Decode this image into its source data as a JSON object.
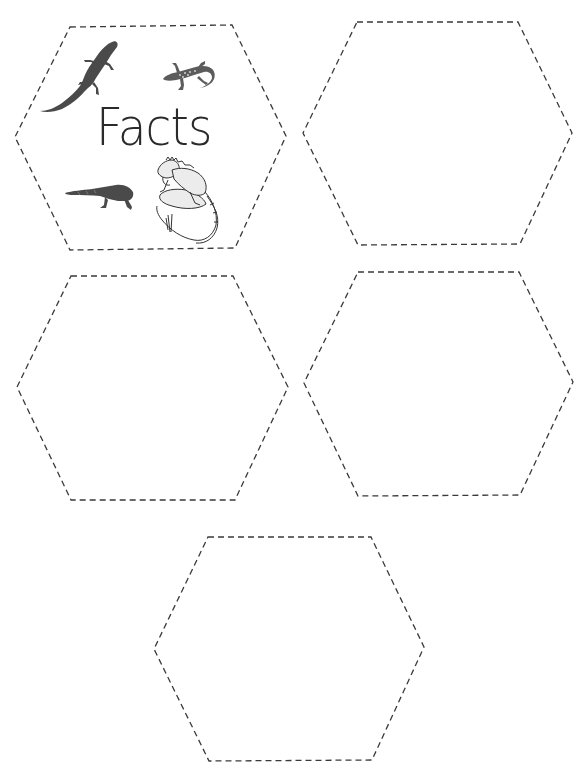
{
  "worksheet": {
    "title": "Facts",
    "colors": {
      "background": "#ffffff",
      "outline": "#3a3a3a",
      "text": "#2a2a2a"
    },
    "cards": [
      {
        "id": 1,
        "shape": "hexagon",
        "outline": "dashed",
        "label": "Facts",
        "illustrations": [
          "collared-lizard-icon",
          "gecko-icon",
          "gila-monster-icon",
          "iguana-icon"
        ]
      },
      {
        "id": 2,
        "shape": "hexagon",
        "outline": "dashed",
        "label": ""
      },
      {
        "id": 3,
        "shape": "hexagon",
        "outline": "dashed",
        "label": ""
      },
      {
        "id": 4,
        "shape": "hexagon",
        "outline": "dashed",
        "label": ""
      },
      {
        "id": 5,
        "shape": "hexagon",
        "outline": "dashed",
        "label": ""
      }
    ]
  }
}
